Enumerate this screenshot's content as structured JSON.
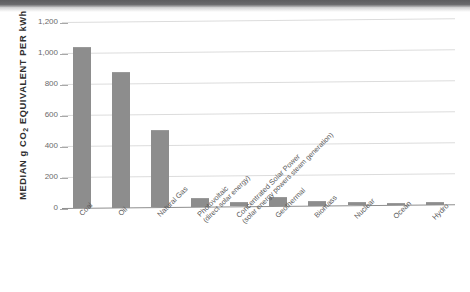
{
  "chart_data": {
    "type": "bar",
    "title": "",
    "subtitle": "",
    "xlabel": "",
    "ylabel": "MEDIAN g CO2 EQUIVALENT PER kWh",
    "ylim": [
      0,
      1200
    ],
    "yticks": [
      "0",
      "200",
      "400",
      "600",
      "800",
      "1,000",
      "1,200"
    ],
    "ytick_values": [
      0,
      200,
      400,
      600,
      800,
      1000,
      1200
    ],
    "grid": true,
    "legend": "none",
    "categories": [
      "Coal",
      "Oil",
      "Natural Gas",
      "Photovoltaic (direct solar energy)",
      "Concentrated Solar Power (solar energy powers steam generation)",
      "Geothermal",
      "Biomass",
      "Nuclear",
      "Ocean",
      "Hydro"
    ],
    "values": [
      1030,
      870,
      490,
      48,
      25,
      50,
      23,
      18,
      8,
      5
    ],
    "bar_color": "#8d8d8d",
    "gridline_color": "#dcdcdc",
    "axis_color": "#8e8e8e"
  },
  "axis": {
    "y_title_main": "MEDIAN g CO",
    "y_title_sub": "2",
    "y_title_tail": " EQUIVALENT PER kWh"
  },
  "x_labels": [
    {
      "line1": "Coal",
      "line2": ""
    },
    {
      "line1": "Oil",
      "line2": ""
    },
    {
      "line1": "Natural Gas",
      "line2": ""
    },
    {
      "line1": "Photovoltaic",
      "line2": "(direct solar energy)"
    },
    {
      "line1": "Concentrated Solar Power",
      "line2": "(solar energy powers steam generation)"
    },
    {
      "line1": "Geothermal",
      "line2": ""
    },
    {
      "line1": "Biomass",
      "line2": ""
    },
    {
      "line1": "Nuclear",
      "line2": ""
    },
    {
      "line1": "Ocean",
      "line2": ""
    },
    {
      "line1": "Hydro",
      "line2": ""
    }
  ]
}
